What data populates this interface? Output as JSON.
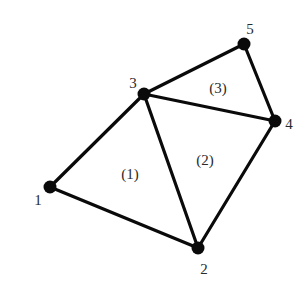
{
  "diagram": {
    "type": "finite-element-mesh",
    "background": "#ffffff",
    "line_color": "#0a0a0a",
    "text_color": "#2a2a2a",
    "nodes": [
      {
        "id": "1",
        "label": "1",
        "x": 50,
        "y": 187,
        "label_x": 38,
        "label_y": 205
      },
      {
        "id": "2",
        "label": "2",
        "x": 198,
        "y": 248,
        "label_x": 204,
        "label_y": 274
      },
      {
        "id": "3",
        "label": "3",
        "x": 144,
        "y": 94,
        "label_x": 133,
        "label_y": 88
      },
      {
        "id": "4",
        "label": "4",
        "x": 275,
        "y": 121,
        "label_x": 289,
        "label_y": 129
      },
      {
        "id": "5",
        "label": "5",
        "x": 244,
        "y": 44,
        "label_x": 250,
        "label_y": 34
      }
    ],
    "edges": [
      {
        "from": "1",
        "to": "3"
      },
      {
        "from": "1",
        "to": "2"
      },
      {
        "from": "3",
        "to": "2"
      },
      {
        "from": "2",
        "to": "4"
      },
      {
        "from": "3",
        "to": "4"
      },
      {
        "from": "3",
        "to": "5"
      },
      {
        "from": "5",
        "to": "4"
      }
    ],
    "elements": [
      {
        "id": "1",
        "label": "(1)",
        "nodes": [
          "1",
          "2",
          "3"
        ],
        "x": 130,
        "y": 179
      },
      {
        "id": "2",
        "label": "(2)",
        "nodes": [
          "2",
          "4",
          "3"
        ],
        "x": 205,
        "y": 165
      },
      {
        "id": "3",
        "label": "(3)",
        "nodes": [
          "3",
          "4",
          "5"
        ],
        "x": 218,
        "y": 93
      }
    ]
  }
}
